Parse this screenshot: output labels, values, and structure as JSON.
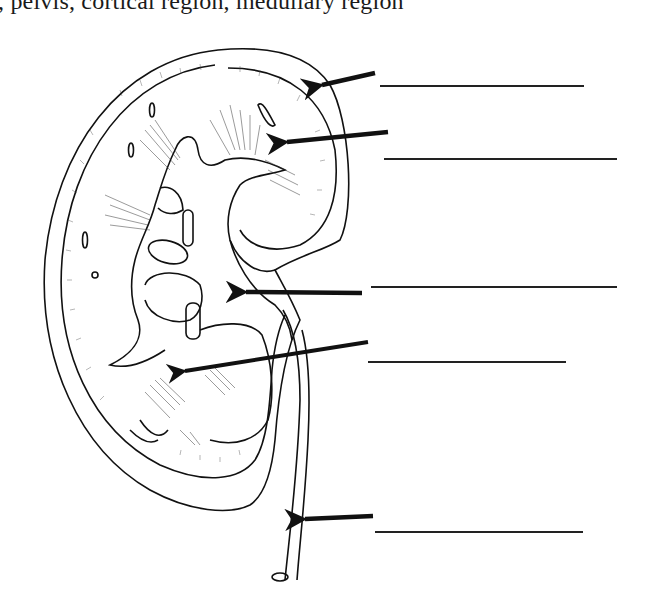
{
  "caption": ", pelvis, cortical region, medullary region",
  "diagram": {
    "arrows": [
      {
        "id": "arrow-1",
        "target": "renal-capsule",
        "tail": [
          375,
          73
        ],
        "head": [
          310,
          88
        ]
      },
      {
        "id": "arrow-2",
        "target": "renal-cortex",
        "tail": [
          388,
          132
        ],
        "head": [
          275,
          143
        ]
      },
      {
        "id": "arrow-3",
        "target": "renal-pelvis",
        "tail": [
          362,
          293
        ],
        "head": [
          232,
          292
        ]
      },
      {
        "id": "arrow-4",
        "target": "renal-pyramid-medulla",
        "tail": [
          368,
          342
        ],
        "head": [
          170,
          373
        ]
      },
      {
        "id": "arrow-5",
        "target": "ureter",
        "tail": [
          373,
          516
        ],
        "head": [
          292,
          520
        ]
      }
    ],
    "answer_lines": [
      {
        "id": "blank-1",
        "x1": 380,
        "x2": 584,
        "y": 86,
        "value": ""
      },
      {
        "id": "blank-2",
        "x1": 384,
        "x2": 617,
        "y": 159,
        "value": ""
      },
      {
        "id": "blank-3",
        "x1": 371,
        "x2": 617,
        "y": 287,
        "value": ""
      },
      {
        "id": "blank-4",
        "x1": 368,
        "x2": 566,
        "y": 362,
        "value": ""
      },
      {
        "id": "blank-5",
        "x1": 375,
        "x2": 583,
        "y": 532,
        "value": ""
      }
    ]
  },
  "colors": {
    "ink": "#111111",
    "paper": "#ffffff"
  }
}
